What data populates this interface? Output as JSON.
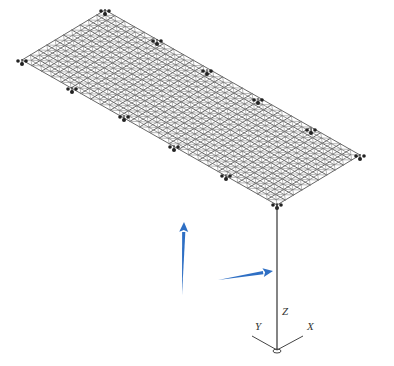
{
  "figure": {
    "colors": {
      "grid_lines": "#555555",
      "support_nodes": "#222222",
      "column": "#333333",
      "arrow": "#2e6fc4",
      "background": "#ffffff"
    },
    "grid": {
      "corners": {
        "top": [
          105,
          10
        ],
        "left": [
          22,
          60
        ],
        "right": [
          360,
          155
        ],
        "bottom": [
          277,
          204
        ]
      },
      "divisions_long": 26,
      "divisions_short": 10
    },
    "supports": [
      [
        105,
        10
      ],
      [
        157,
        40
      ],
      [
        207,
        70
      ],
      [
        258,
        99
      ],
      [
        311,
        129
      ],
      [
        360,
        155
      ],
      [
        22,
        60
      ],
      [
        72,
        88
      ],
      [
        124,
        116
      ],
      [
        174,
        146
      ],
      [
        226,
        175
      ],
      [
        277,
        204
      ]
    ],
    "column": {
      "top": [
        277,
        204
      ],
      "bottom": [
        277,
        350
      ]
    },
    "arrows": [
      {
        "name": "vertical-arrow",
        "from": [
          182,
          295
        ],
        "to": [
          184,
          222
        ]
      },
      {
        "name": "horizontal-arrow",
        "from": [
          218,
          280
        ],
        "to": [
          273,
          271
        ]
      }
    ],
    "axes": {
      "origin": [
        277,
        350
      ],
      "labels": {
        "z": "Z",
        "y": "Y",
        "x": "X"
      }
    }
  }
}
